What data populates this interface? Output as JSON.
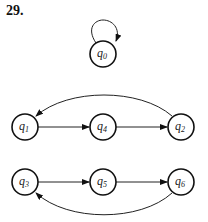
{
  "problem_number": "29.",
  "nodes": [
    {
      "id": "q0",
      "base": "q",
      "sub": "0",
      "x": 103,
      "y": 54
    },
    {
      "id": "q1",
      "base": "q",
      "sub": "1",
      "x": 25,
      "y": 127
    },
    {
      "id": "q4",
      "base": "q",
      "sub": "4",
      "x": 103,
      "y": 127
    },
    {
      "id": "q2",
      "base": "q",
      "sub": "2",
      "x": 181,
      "y": 127
    },
    {
      "id": "q3",
      "base": "q",
      "sub": "3",
      "x": 25,
      "y": 182
    },
    {
      "id": "q5",
      "base": "q",
      "sub": "5",
      "x": 103,
      "y": 182
    },
    {
      "id": "q6",
      "base": "q",
      "sub": "6",
      "x": 181,
      "y": 182
    }
  ],
  "edges": [
    {
      "from": "q0",
      "to": "q0",
      "type": "self-loop"
    },
    {
      "from": "q1",
      "to": "q4",
      "type": "straight"
    },
    {
      "from": "q4",
      "to": "q2",
      "type": "straight"
    },
    {
      "from": "q2",
      "to": "q1",
      "type": "arc-above"
    },
    {
      "from": "q3",
      "to": "q5",
      "type": "straight"
    },
    {
      "from": "q5",
      "to": "q6",
      "type": "straight"
    },
    {
      "from": "q6",
      "to": "q3",
      "type": "arc-below"
    }
  ]
}
